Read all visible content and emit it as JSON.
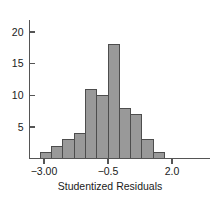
{
  "chart_data": {
    "type": "bar",
    "title": "",
    "xlabel": "Studentized Residuals",
    "ylabel": "",
    "grid": false,
    "legend": "none",
    "bar_color": "#999999",
    "bar_edge_color": "#4d4d4d",
    "axis_color": "#555555",
    "bin_width": 0.44,
    "bin_edges": [
      -3.14,
      -2.7,
      -2.26,
      -1.82,
      -1.38,
      -0.94,
      -0.5,
      -0.06,
      0.38,
      0.82,
      1.26,
      1.7,
      2.14
    ],
    "categories": [
      "-3.14 to -2.70",
      "-2.70 to -2.26",
      "-2.26 to -1.82",
      "-1.82 to -1.38",
      "-1.38 to -0.94",
      "-0.94 to -0.50",
      "-0.50 to -0.06",
      "-0.06 to 0.38",
      "0.38 to 0.82",
      "0.82 to 1.26",
      "1.26 to 1.70",
      "1.70 to 2.14"
    ],
    "values": [
      1,
      2,
      3,
      4,
      11,
      10,
      18,
      8,
      7,
      3,
      1,
      0
    ],
    "xlim": [
      -3.35,
      2.35
    ],
    "ylim": [
      0,
      22
    ],
    "xticks": [
      -3.0,
      -0.5,
      2.0
    ],
    "xticklabels": [
      "−3.00",
      "−0.5",
      "2.0"
    ],
    "yticks": [
      5,
      10,
      15,
      20
    ],
    "yticklabels": [
      "5",
      "10",
      "15",
      "20"
    ]
  }
}
